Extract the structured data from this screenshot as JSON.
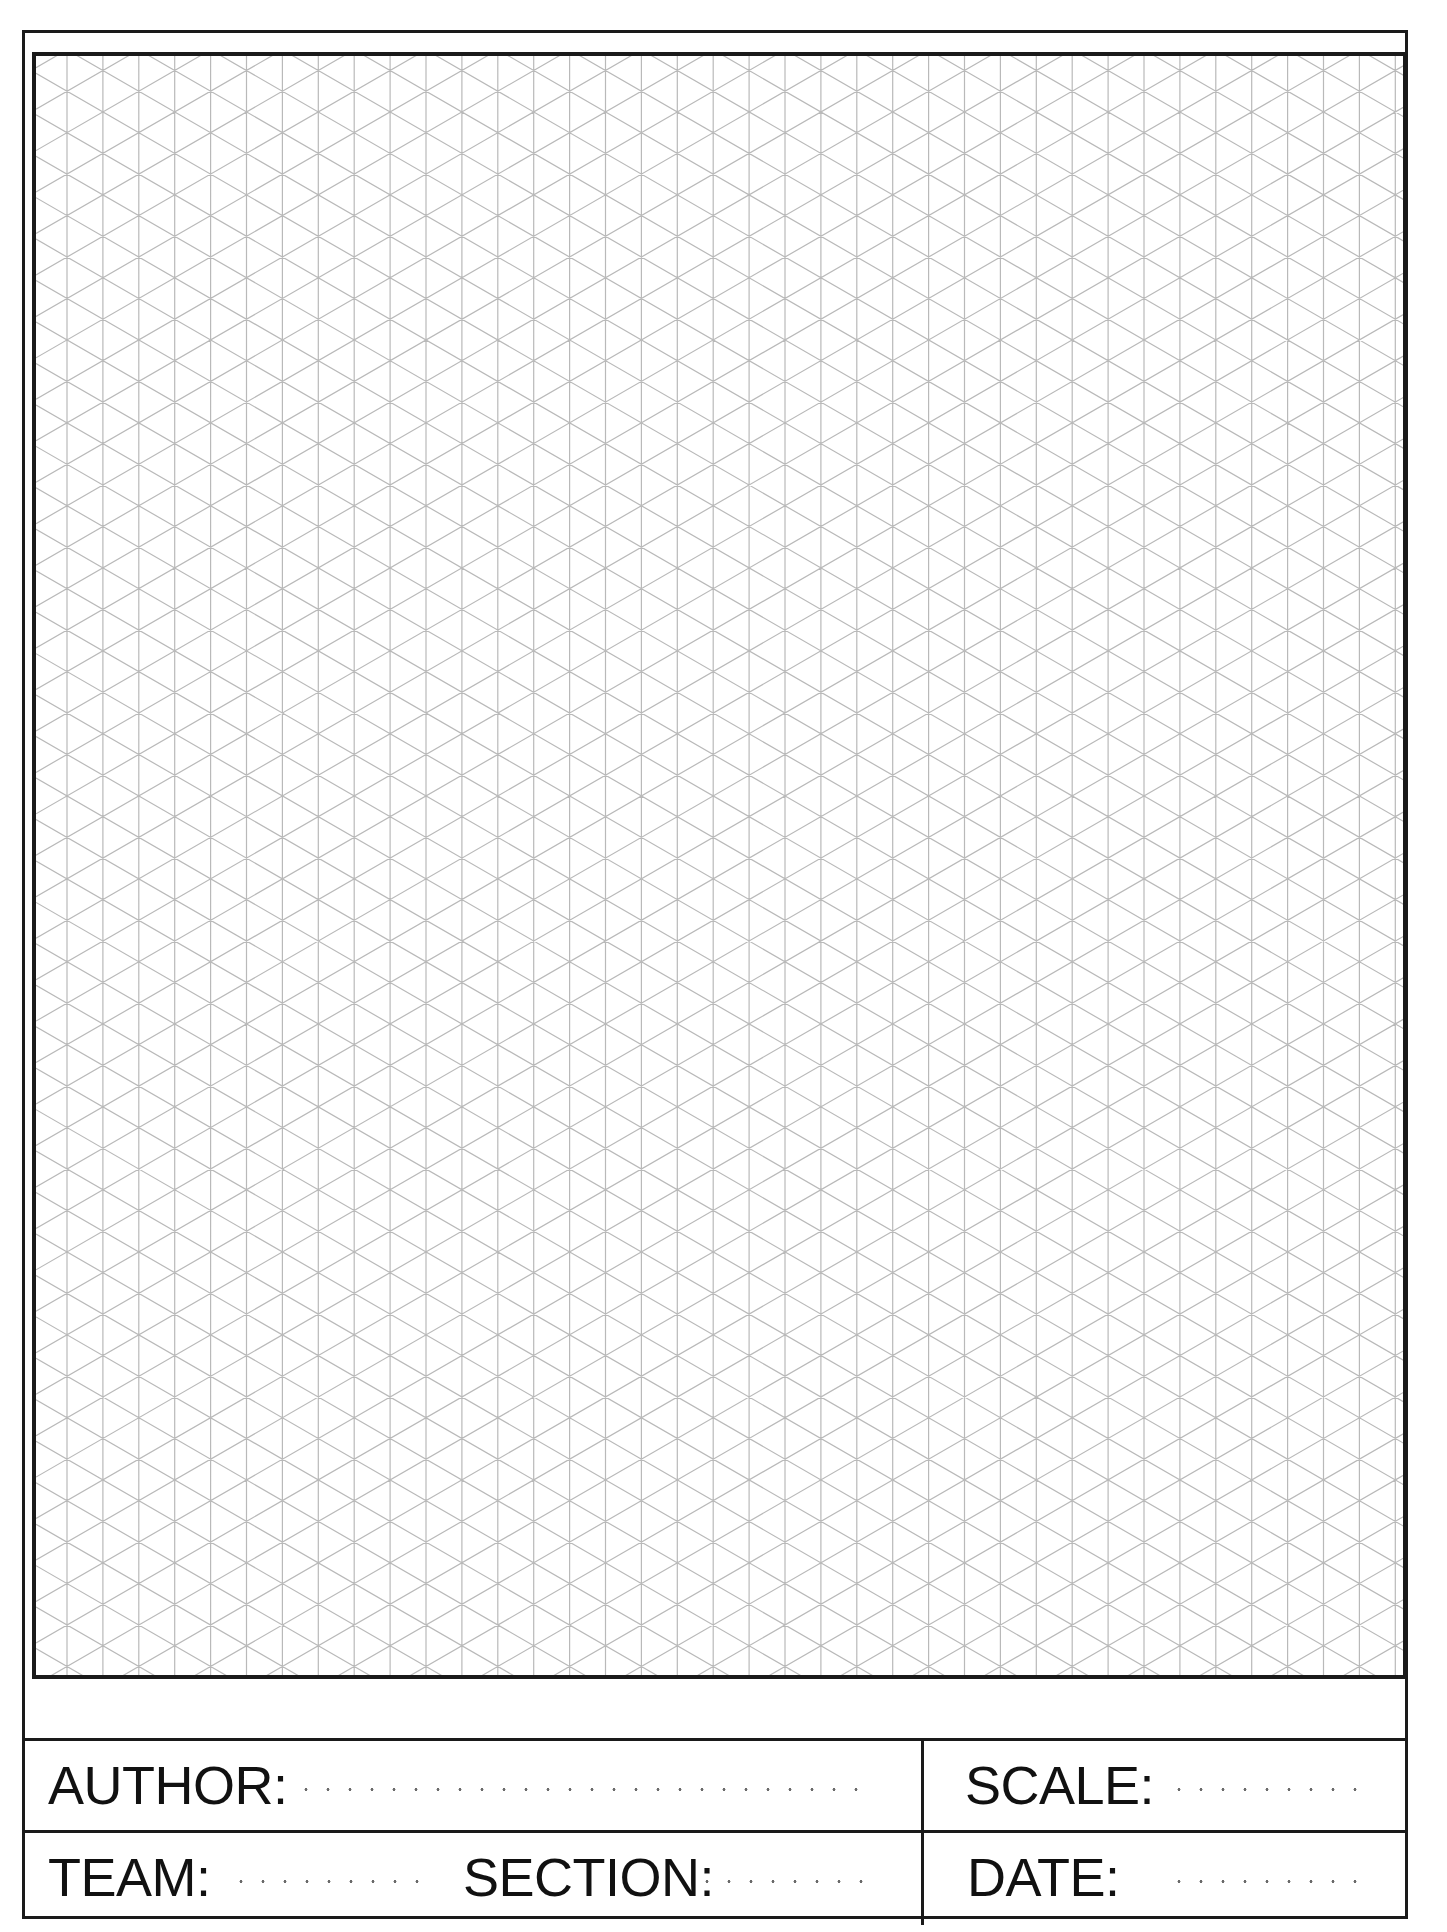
{
  "page": {
    "type": "isometric-grid-drawing-sheet",
    "grid": {
      "style": "isometric (30° diagonals + vertical lines)",
      "vertical_line_spacing_px": 35.9,
      "line_color": "#b9b9b9",
      "node_color": "#8c8c8c"
    },
    "frame_color": "#1a1a1a"
  },
  "title_block": {
    "author": {
      "label": "AUTHOR:",
      "value": ""
    },
    "team": {
      "label": "TEAM:",
      "value": ""
    },
    "section": {
      "label": "SECTION:",
      "value": ""
    },
    "scale": {
      "label": "SCALE:",
      "value": ""
    },
    "date": {
      "label": "DATE:",
      "value": ""
    }
  }
}
